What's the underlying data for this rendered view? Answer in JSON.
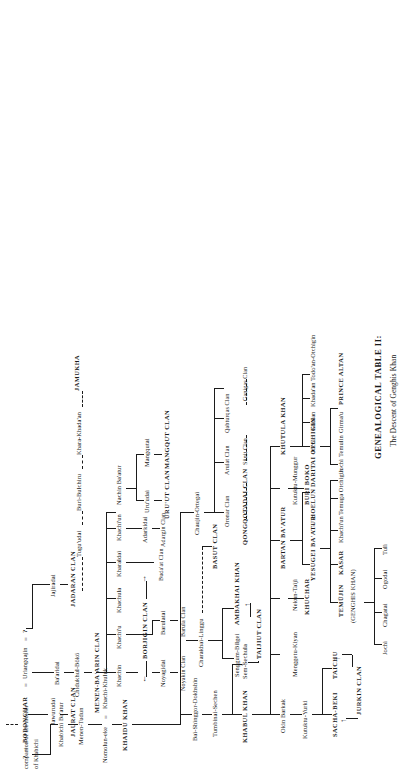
{
  "title": {
    "line1": "GENEALOGICAL TABLE II:",
    "line2": "The Descent of Genghis Khan"
  },
  "notes": {
    "companion_line1": "companion of the mother",
    "companion_line2": "of Khabichi",
    "unknown": "?",
    "equals": "="
  },
  "people": {
    "bodonchar": "BODONCHAR",
    "uriangqajin": "Uriangqajin",
    "q_left": "?",
    "q_right": "?",
    "jawurudai": "Jawurudai",
    "khabichi_baatur": "Khabichi Ba'atur",
    "baaridai": "Ba'aridai",
    "jajiradai": "Jajiradai",
    "menen_tudun": "Menen-Tudun",
    "chidukhul_boko": "Chidukhul-Bökö",
    "tuguudai": "Tugu'udai",
    "buri_bulchiru": "Buri-Bulchiru",
    "khara_khadaan": "Khara-Khada'an",
    "jamukha": "JAMUKHA",
    "nomolun_eke": "Nomolun-eke",
    "khachi_khuluk": "Khachi-Khuluk",
    "khaidu_khan": "KHAIDU KHAN",
    "khachin": "Khachin",
    "khachiu": "Khachi'u",
    "khachula": "Khachula",
    "kharaldai": "Kharaldai",
    "khachiun": "Khachi'un",
    "nachin_baatur": "Nachin Ba'atur",
    "noyagidai": "Noyagidai",
    "barulatai": "Barulatai",
    "adarkidai": "Adarkidai",
    "uruudai": "Uru'udai",
    "mangqutai": "Mangqutai",
    "bai_shinggor": "Bai-Shinggor-Dokhshin",
    "tumbinai_sechen": "Tumbinai-Sechen",
    "charakhai_linggu": "Charakhai-Linggu",
    "chaujin_ortegai": "Chaujin-Ortegai",
    "khabul_khan": "KHABUL KHAN",
    "sem_sechula": "Sem-Sechula",
    "senggum_bilgei": "Senggum-Bilgei",
    "ambakhai_khan": "AMBAKHAI KHAN",
    "okin_barkak": "Okin Barkak",
    "bartan_baatur": "BARTAN BA'ATUR",
    "kutuktu_yurki": "Kutuktu-Yurki",
    "menggetu_kiyan": "Menggetu-Kiyan",
    "nekun_taiji": "Nekun-Taiji",
    "kutuktu_munggur": "Kutuktu-Munggur",
    "khutula_khan": "KHUTULA KHAN",
    "sacha_beki": "SACHA-BEKI",
    "taichu": "TAICHU",
    "khuchar": "KHUCHAR",
    "yesugei_baatur": "YESUGEI BA'ATUR",
    "hoelun": "HOELUN",
    "daritai_otchigin": "DARITAI Otchigin",
    "buri_boko": "BURI BOKO",
    "temujin": "TEMÜJIN",
    "temujin_note": "(GENGHIS KHAN)",
    "kasar": "KASAR",
    "khachiun2": "Khachi'un",
    "temuga_otchigin": "Temuga Otchigin",
    "temulin": "Temulin",
    "jochi2": "Jochi",
    "khulan": "Khulan",
    "khadaan": "Khada'an",
    "todoan_otchigin": "Todo'an-Otchigin",
    "jochi": "Jochi",
    "girmau": "Girma'u",
    "prince_altan": "PRINCE ALTAN",
    "jochi_son": "Jochi",
    "chagatai": "Chagatai",
    "ogodai": "Ogodai",
    "tuli": "Tuli"
  },
  "clans": {
    "jaurat": "JAURAT CLAN",
    "jadaran": "JADARAN CLAN",
    "menen_baarin": "MENEN-BA'ARIN CLAN",
    "borjigin": "BORJIGIN CLAN",
    "noyakin": "Noyakin Clan",
    "barula": "Barula Clan",
    "budaat": "Buda'at Clan",
    "adargin": "Adargin Clan",
    "uruut": "URU'UT CLAN",
    "mangqut": "MANGQUT CLAN",
    "oronar": "Oronar Clan",
    "qongqotadai": "QONGQOTADAI CLAN",
    "arulat": "Arulat Clan",
    "sunit": "Sünit Clan",
    "qabturqas": "Qabturqas Clan",
    "ganigas": "Ganigas Clan",
    "taijiut": "TAIJIUT CLAN",
    "basut": "BASUT CLAN",
    "jurkin": "JURKIN CLAN"
  },
  "arrows": {
    "right": "→",
    "left": "←",
    "up": "↑"
  }
}
